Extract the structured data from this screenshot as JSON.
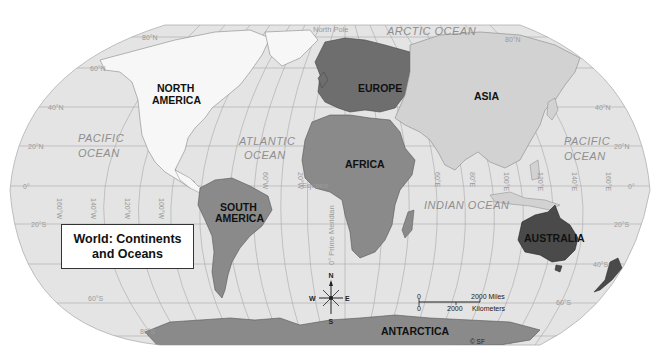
{
  "title": {
    "line1": "World: Continents",
    "line2": "and Oceans"
  },
  "continents": {
    "north_america": {
      "line1": "NORTH",
      "line2": "AMERICA"
    },
    "south_america": {
      "line1": "SOUTH",
      "line2": "AMERICA"
    },
    "europe": "EUROPE",
    "asia": "ASIA",
    "africa": "AFRICA",
    "australia": "AUSTRALIA",
    "antarctica": "ANTARCTICA"
  },
  "oceans": {
    "pacific_west": {
      "line1": "PACIFIC",
      "line2": "OCEAN"
    },
    "pacific_east": {
      "line1": "PACIFIC",
      "line2": "OCEAN"
    },
    "atlantic": {
      "line1": "ATLANTIC",
      "line2": "OCEAN"
    },
    "indian": "INDIAN OCEAN",
    "arctic": "ARCTIC OCEAN"
  },
  "reference_lines": {
    "north_pole": "North Pole",
    "equator": "Equator",
    "prime_meridian": "0° Prime Meridian"
  },
  "latitudes": {
    "n80_left": "80°N",
    "n80_right": "80°N",
    "n60": "60°N",
    "n40_left": "40°N",
    "n40_right": "40°N",
    "n20_left": "20°N",
    "n20_right": "20°N",
    "eq_left": "0°",
    "eq_right": "0°",
    "s20_left": "20°S",
    "s20_right": "20°S",
    "s40": "40°S",
    "s60_left": "60°S",
    "s60_right": "60°S",
    "s80": "80°S"
  },
  "longitudes": [
    "160°W",
    "140°W",
    "120°W",
    "100°W",
    "80°W",
    "60°W",
    "40°W",
    "20°W",
    "20°E",
    "40°E",
    "60°E",
    "80°E",
    "100°E",
    "120°E",
    "140°E",
    "160°E"
  ],
  "compass": {
    "n": "N",
    "s": "S",
    "e": "E",
    "w": "W"
  },
  "scale": {
    "miles_zero": "0",
    "miles_value": "2000 Miles",
    "km_zero": "0",
    "km_value": "2000",
    "km_unit": "Kilometers"
  },
  "copyright": "© SF",
  "colors": {
    "ocean": "#e4e4e4",
    "north_america": "#f7f7f7",
    "asia": "#d2d2d2",
    "europe": "#6e6e6e",
    "africa": "#8a8a8a",
    "south_america": "#8a8a8a",
    "australia": "#4a4a4a",
    "antarctica": "#8a8a8a",
    "grid": "#a8a8a8"
  }
}
